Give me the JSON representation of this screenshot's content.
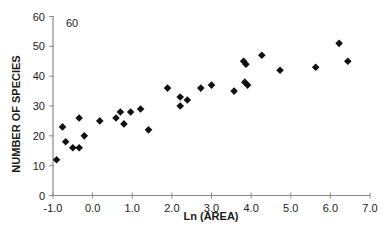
{
  "chart_data": {
    "type": "scatter",
    "title": "",
    "annotation": "60",
    "xlabel": "Ln (AREA)",
    "ylabel": "NUMBER OF SPECIES",
    "xlim": [
      -1.0,
      7.0
    ],
    "ylim": [
      0,
      60
    ],
    "x_ticks": [
      "-1.0",
      "0.0",
      "1.0",
      "2.0",
      "3.0",
      "4.0",
      "5.0",
      "6.0",
      "7.0"
    ],
    "y_ticks": [
      "0",
      "10",
      "20",
      "30",
      "40",
      "50",
      "60"
    ],
    "grid": false,
    "legend": null,
    "marker": "diamond",
    "marker_color": "#111111",
    "axis_color": "#8a8a8a",
    "series": [
      {
        "name": "species-area",
        "points": [
          [
            -0.91,
            12
          ],
          [
            -0.76,
            23
          ],
          [
            -0.68,
            18
          ],
          [
            -0.5,
            16
          ],
          [
            -0.34,
            16
          ],
          [
            -0.34,
            26
          ],
          [
            -0.21,
            20
          ],
          [
            0.18,
            25
          ],
          [
            0.59,
            26
          ],
          [
            0.7,
            28
          ],
          [
            0.79,
            24
          ],
          [
            0.96,
            28
          ],
          [
            1.21,
            29
          ],
          [
            1.41,
            22
          ],
          [
            1.89,
            36
          ],
          [
            2.21,
            33
          ],
          [
            2.21,
            30
          ],
          [
            2.39,
            32
          ],
          [
            2.73,
            36
          ],
          [
            3.0,
            37
          ],
          [
            3.57,
            35
          ],
          [
            3.81,
            45
          ],
          [
            3.87,
            44
          ],
          [
            3.84,
            38
          ],
          [
            3.91,
            37
          ],
          [
            4.27,
            47
          ],
          [
            4.73,
            42
          ],
          [
            5.63,
            43
          ],
          [
            6.22,
            51
          ],
          [
            6.44,
            45
          ]
        ]
      }
    ]
  }
}
